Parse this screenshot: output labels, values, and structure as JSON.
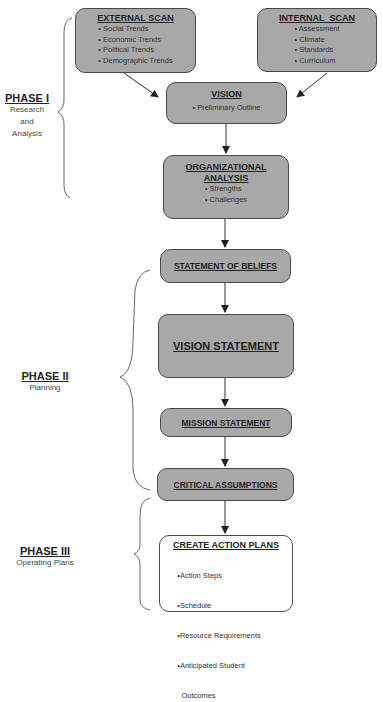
{
  "phases": [
    {
      "title": "PHASE I",
      "subtitle_lines": [
        "Research",
        "and",
        "Analysis"
      ]
    },
    {
      "title": "PHASE II",
      "subtitle_lines": [
        "Planning"
      ]
    },
    {
      "title": "PHASE III",
      "subtitle_lines": [
        "Operating  Plans"
      ]
    }
  ],
  "boxes": {
    "external_scan": {
      "title": "EXTERNAL SCAN",
      "items": [
        "• Social Trends",
        "• Economic Trends",
        "• Political Trends",
        "• Demographic Trends"
      ]
    },
    "internal_scan": {
      "title": "INTERNAL  SCAN",
      "items": [
        "• Assessment",
        "• Climate",
        "• Standards",
        "• Curriculum"
      ]
    },
    "vision": {
      "title": "VISION",
      "items": [
        "• Preliminary Outline"
      ]
    },
    "org_analysis": {
      "title_lines": [
        "ORGANIZATIONAL",
        "ANALYSIS"
      ],
      "items": [
        "• Strengths",
        "• Challenges"
      ]
    },
    "beliefs": {
      "title": "STATEMENT OF BELIEFS"
    },
    "vision_statement": {
      "title": "VISION STATEMENT"
    },
    "mission": {
      "title": "MISSION STATEMENT"
    },
    "assumptions": {
      "title": "CRITICAL ASSUMPTIONS"
    },
    "action_plans": {
      "title": "CREATE ACTION PLANS",
      "items": [
        "•Action Steps",
        "•Schedule",
        "•Resource Requirements",
        "•Anticipated Student",
        "  Outcomes"
      ]
    }
  },
  "colors": {
    "box_fill": "#a8a8a8",
    "border": "#4a4a4a",
    "arrow": "#222222"
  }
}
